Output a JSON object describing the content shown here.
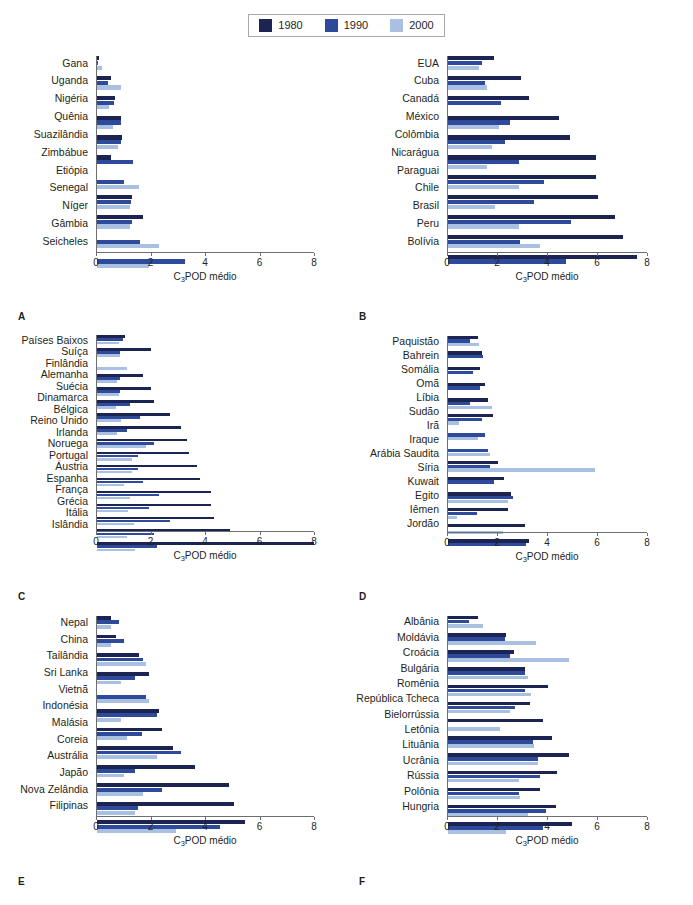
{
  "legend": {
    "entries": [
      {
        "label": "1980",
        "color": "#1b2453"
      },
      {
        "label": "1990",
        "color": "#2e4b9b"
      },
      {
        "label": "2000",
        "color": "#aac0e2"
      }
    ]
  },
  "axis": {
    "title": "C POD médio",
    "title_prefix": "C",
    "title_sub": "3",
    "title_suffix": "POD médio",
    "ticks": [
      0,
      2,
      4,
      6,
      8
    ],
    "min": 0,
    "max": 8
  },
  "chart_data": [
    {
      "type": "bar",
      "panel": "A",
      "orientation": "horizontal",
      "title": "",
      "xlabel": "C3POD médio",
      "ylabel": "",
      "xlim": [
        0,
        8
      ],
      "grid": false,
      "legend_position": "top-center",
      "categories": [
        "Gana",
        "Uganda",
        "Nigéria",
        "Quênia",
        "Suazilândia",
        "Zimbábue",
        "Etiópia",
        "Senegal",
        "Níger",
        "Gâmbia",
        "Seicheles"
      ],
      "series": [
        {
          "name": "1980",
          "values": [
            0.08,
            0.5,
            0.68,
            0.88,
            0.92,
            0.5,
            0.0,
            1.3,
            1.7,
            0.0,
            0.0
          ]
        },
        {
          "name": "1990",
          "values": [
            0.05,
            0.42,
            0.62,
            0.9,
            0.88,
            1.32,
            1.0,
            1.25,
            1.28,
            1.58,
            3.25
          ]
        },
        {
          "name": "2000",
          "values": [
            0.2,
            0.9,
            0.45,
            0.6,
            0.78,
            0.0,
            1.55,
            1.2,
            1.22,
            2.3,
            1.9
          ]
        }
      ]
    },
    {
      "type": "bar",
      "panel": "B",
      "orientation": "horizontal",
      "title": "",
      "xlabel": "C3POD médio",
      "ylabel": "",
      "xlim": [
        0,
        8
      ],
      "grid": false,
      "legend_position": "top-center",
      "categories": [
        "EUA",
        "Cuba",
        "Canadá",
        "México",
        "Colômbia",
        "Nicarágua",
        "Paraguai",
        "Chile",
        "Brasil",
        "Peru",
        "Bolívia"
      ],
      "series": [
        {
          "name": "1980",
          "values": [
            1.85,
            2.95,
            3.25,
            4.45,
            4.9,
            5.95,
            5.95,
            6.05,
            6.7,
            7.05,
            7.6
          ]
        },
        {
          "name": "1990",
          "values": [
            1.35,
            1.5,
            2.15,
            2.5,
            2.3,
            2.85,
            3.85,
            3.45,
            4.95,
            2.9,
            4.75
          ]
        },
        {
          "name": "2000",
          "values": [
            1.25,
            1.55,
            0.0,
            2.05,
            1.75,
            1.55,
            2.85,
            1.9,
            2.85,
            3.7,
            0.0
          ]
        }
      ]
    },
    {
      "type": "bar",
      "panel": "C",
      "orientation": "horizontal",
      "title": "",
      "xlabel": "C3POD médio",
      "ylabel": "",
      "xlim": [
        0,
        8
      ],
      "grid": false,
      "legend_position": "top-center",
      "categories": [
        "Países Baixos",
        "Suíça",
        "Finlândia",
        "Alemanha",
        "Suécia",
        "Dinamarca",
        "Bélgica",
        "Reino Unido",
        "Irlanda",
        "Noruega",
        "Portugal",
        "Áustria",
        "Espanha",
        "França",
        "Grécia",
        "Itália",
        "Islândia"
      ],
      "series": [
        {
          "name": "1980",
          "values": [
            1.05,
            2.0,
            0.0,
            1.7,
            2.0,
            2.1,
            2.7,
            3.1,
            3.3,
            3.4,
            3.7,
            3.8,
            4.2,
            4.2,
            4.3,
            4.9,
            8.0
          ]
        },
        {
          "name": "1990",
          "values": [
            0.95,
            0.85,
            0.0,
            0.85,
            0.85,
            1.2,
            1.6,
            1.1,
            2.1,
            1.5,
            1.5,
            1.7,
            2.3,
            1.9,
            2.7,
            2.1,
            2.2
          ]
        },
        {
          "name": "2000",
          "values": [
            0.8,
            0.85,
            1.1,
            0.75,
            0.8,
            0.7,
            0.9,
            0.75,
            1.8,
            1.3,
            1.3,
            1.0,
            1.2,
            1.15,
            1.35,
            1.1,
            1.4
          ]
        }
      ]
    },
    {
      "type": "bar",
      "panel": "D",
      "orientation": "horizontal",
      "title": "",
      "xlabel": "C3POD médio",
      "ylabel": "",
      "xlim": [
        0,
        8
      ],
      "grid": false,
      "legend_position": "top-center",
      "categories": [
        "Paquistão",
        "Bahrein",
        "Somália",
        "Omã",
        "Líbia",
        "Sudão",
        "Irã",
        "Iraque",
        "Arábia Saudita",
        "Síria",
        "Kuwait",
        "Egito",
        "Iêmen",
        "Jordão"
      ],
      "series": [
        {
          "name": "1980",
          "values": [
            1.2,
            1.35,
            1.3,
            1.5,
            1.6,
            1.8,
            0.0,
            0.0,
            2.0,
            2.25,
            2.55,
            2.4,
            3.1,
            3.25
          ]
        },
        {
          "name": "1990",
          "values": [
            0.9,
            1.4,
            1.0,
            1.3,
            0.9,
            1.35,
            1.5,
            1.6,
            1.7,
            1.85,
            2.6,
            1.15,
            0.0,
            3.15
          ]
        },
        {
          "name": "2000",
          "values": [
            1.25,
            0.0,
            0.0,
            0.0,
            1.75,
            0.45,
            1.2,
            1.7,
            5.9,
            0.0,
            2.4,
            0.35,
            2.2,
            0.0
          ]
        }
      ]
    },
    {
      "type": "bar",
      "panel": "E",
      "orientation": "horizontal",
      "title": "",
      "xlabel": "C3POD médio",
      "ylabel": "",
      "xlim": [
        0,
        8
      ],
      "grid": false,
      "legend_position": "top-center",
      "categories": [
        "Nepal",
        "China",
        "Tailândia",
        "Sri Lanka",
        "Vietnã",
        "Indonésia",
        "Malásia",
        "Coreia",
        "Austrália",
        "Japão",
        "Nova Zelândia",
        "Filipinas"
      ],
      "series": [
        {
          "name": "1980",
          "values": [
            0.5,
            0.7,
            1.55,
            1.9,
            0.0,
            2.3,
            2.4,
            2.8,
            3.6,
            4.85,
            5.05,
            5.45
          ]
        },
        {
          "name": "1990",
          "values": [
            0.8,
            1.0,
            1.7,
            1.4,
            1.8,
            2.2,
            1.65,
            3.1,
            1.4,
            2.4,
            1.5,
            4.55
          ]
        },
        {
          "name": "2000",
          "values": [
            0.5,
            0.5,
            1.8,
            0.9,
            1.9,
            0.9,
            1.1,
            2.2,
            1.0,
            1.7,
            1.4,
            2.9
          ]
        }
      ]
    },
    {
      "type": "bar",
      "panel": "F",
      "orientation": "horizontal",
      "title": "",
      "xlabel": "C3POD médio",
      "ylabel": "",
      "xlim": [
        0,
        8
      ],
      "grid": false,
      "legend_position": "top-center",
      "categories": [
        "Albânia",
        "Moldávia",
        "Croácia",
        "Bulgária",
        "Romênia",
        "República Tcheca",
        "Bielorrússia",
        "Letônia",
        "Lituânia",
        "Ucrânia",
        "Rússia",
        "Polônia",
        "Hungria"
      ],
      "series": [
        {
          "name": "1980",
          "values": [
            1.2,
            2.35,
            2.65,
            3.1,
            4.0,
            3.3,
            3.8,
            4.2,
            4.85,
            4.4,
            3.7,
            4.35,
            5.0
          ]
        },
        {
          "name": "1990",
          "values": [
            0.85,
            2.3,
            2.5,
            3.1,
            3.1,
            2.7,
            0.0,
            3.4,
            3.6,
            3.7,
            2.85,
            3.95,
            3.8
          ]
        },
        {
          "name": "2000",
          "values": [
            1.4,
            3.55,
            4.85,
            3.2,
            3.35,
            2.5,
            2.1,
            3.45,
            3.6,
            2.85,
            2.9,
            3.2,
            2.35
          ]
        }
      ]
    }
  ],
  "panels": [
    {
      "letter": "A"
    },
    {
      "letter": "B"
    },
    {
      "letter": "C"
    },
    {
      "letter": "D"
    },
    {
      "letter": "E"
    },
    {
      "letter": "F"
    }
  ]
}
